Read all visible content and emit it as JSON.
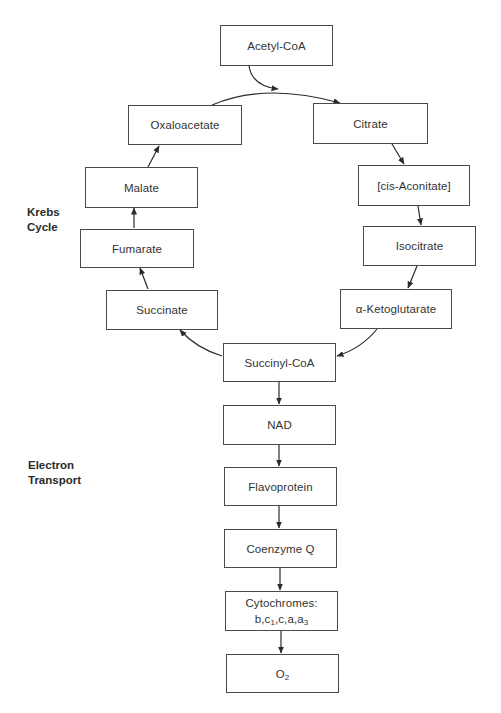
{
  "diagram": {
    "colors": {
      "stroke": "#2a2a2a",
      "box_border": "#4a4a4a",
      "text": "#333333",
      "background": "#ffffff"
    },
    "section_labels": {
      "krebs": {
        "line1": "Krebs",
        "line2": "Cycle"
      },
      "electron": {
        "line1": "Electron",
        "line2": "Transport"
      }
    },
    "nodes": {
      "acetyl_coa": "Acetyl-CoA",
      "oxaloacetate": "Oxaloacetate",
      "citrate": "Citrate",
      "cis_aconitate": "[cis-Aconitate]",
      "malate": "Malate",
      "isocitrate": "Isocitrate",
      "fumarate": "Fumarate",
      "succinate": "Succinate",
      "alpha_ketoglutarate": "α-Ketoglutarate",
      "succinyl_coa": "Succinyl-CoA",
      "nad": "NAD",
      "flavoprotein": "Flavoprotein",
      "coenzyme_q": "Coenzyme Q",
      "cytochromes": {
        "line1": "Cytochromes:",
        "line2_parts": [
          "b,c",
          "1",
          ",c,a,a",
          "3"
        ]
      },
      "o2": {
        "base": "O",
        "sub": "2"
      }
    },
    "edges": [
      {
        "from": "Acetyl-CoA",
        "to": "Citrate"
      },
      {
        "from": "Oxaloacetate",
        "to": "Citrate"
      },
      {
        "from": "Citrate",
        "to": "[cis-Aconitate]"
      },
      {
        "from": "[cis-Aconitate]",
        "to": "Isocitrate"
      },
      {
        "from": "Isocitrate",
        "to": "α-Ketoglutarate"
      },
      {
        "from": "α-Ketoglutarate",
        "to": "Succinyl-CoA"
      },
      {
        "from": "Succinyl-CoA",
        "to": "Succinate"
      },
      {
        "from": "Succinate",
        "to": "Fumarate"
      },
      {
        "from": "Fumarate",
        "to": "Malate"
      },
      {
        "from": "Malate",
        "to": "Oxaloacetate"
      },
      {
        "from": "Succinyl-CoA",
        "to": "NAD"
      },
      {
        "from": "NAD",
        "to": "Flavoprotein"
      },
      {
        "from": "Flavoprotein",
        "to": "Coenzyme Q"
      },
      {
        "from": "Coenzyme Q",
        "to": "Cytochromes: b,c1,c,a,a3"
      },
      {
        "from": "Cytochromes: b,c1,c,a,a3",
        "to": "O2"
      }
    ]
  }
}
